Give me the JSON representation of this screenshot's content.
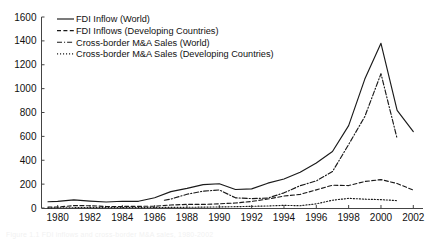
{
  "figure": {
    "caption": "Figure 1.1  FDI inflows and cross-border M&A sales, 1980-2002",
    "caption_visible": false
  },
  "chart_data": {
    "type": "line",
    "title": "",
    "xlabel": "",
    "ylabel": "",
    "xlim": [
      1979,
      2002.6
    ],
    "ylim": [
      0,
      1600
    ],
    "grid": false,
    "legend_position": "top-left-inside",
    "xticks": [
      1980,
      1982,
      1984,
      1986,
      1988,
      1990,
      1992,
      1994,
      1996,
      1998,
      2000,
      2002
    ],
    "xtick_labels": [
      "1980",
      "1982",
      "1984",
      "1986",
      "1988",
      "1990",
      "1992",
      "1994",
      "1996",
      "1998",
      "2000",
      "2002"
    ],
    "yticks": [
      0,
      200,
      400,
      600,
      800,
      1000,
      1200,
      1400,
      1600
    ],
    "ytick_labels": [
      "0",
      "200",
      "400",
      "600",
      "800",
      "1000",
      "1200",
      "1400",
      "1600"
    ],
    "series": [
      {
        "name": "FDI Inflow (World)",
        "style": "solid",
        "x": [
          1979.4,
          1980,
          1981,
          1982,
          1983,
          1984,
          1985,
          1986,
          1987,
          1988,
          1989,
          1990,
          1991,
          1992,
          1993,
          1994,
          1995,
          1996,
          1997,
          1998,
          1999,
          2000,
          2001,
          2002
        ],
        "values": [
          52,
          55,
          68,
          58,
          50,
          57,
          56,
          86,
          137,
          164,
          196,
          203,
          155,
          160,
          208,
          243,
          300,
          377,
          473,
          690,
          1080,
          1380,
          818,
          640
        ]
      },
      {
        "name": "FDI Inflows (Developing Countries)",
        "style": "dashed",
        "x": [
          1979.4,
          1980,
          1981,
          1982,
          1983,
          1984,
          1985,
          1986,
          1987,
          1988,
          1989,
          1990,
          1991,
          1992,
          1993,
          1994,
          1995,
          1996,
          1997,
          1998,
          1999,
          2000,
          2001,
          2002
        ],
        "values": [
          8,
          8,
          20,
          19,
          13,
          13,
          14,
          15,
          25,
          30,
          30,
          35,
          42,
          55,
          75,
          100,
          114,
          152,
          191,
          188,
          222,
          238,
          205,
          150
        ]
      },
      {
        "name": "Cross-border M&A Sales (World)",
        "style": "dashdot",
        "x": [
          1986.6,
          1987,
          1988,
          1989,
          1990,
          1991,
          1992,
          1993,
          1994,
          1995,
          1996,
          1997,
          1998,
          1999,
          2000,
          2001
        ],
        "values": [
          65,
          75,
          115,
          141,
          151,
          85,
          79,
          83,
          127,
          187,
          227,
          305,
          532,
          766,
          1125,
          580
        ]
      },
      {
        "name": "Cross-border M&A Sales (Developing Countries)",
        "style": "dotted",
        "x": [
          1979.4,
          1980,
          1982,
          1984,
          1986,
          1987,
          1988,
          1989,
          1990,
          1991,
          1992,
          1993,
          1994,
          1995,
          1996,
          1997,
          1998,
          1999,
          2000,
          2001
        ],
        "values": [
          1,
          2,
          3,
          3,
          4,
          5,
          6,
          7,
          9,
          11,
          14,
          17,
          22,
          19,
          35,
          65,
          81,
          74,
          70,
          62
        ]
      }
    ],
    "legend": [
      {
        "label": "FDI Inflow (World)",
        "style": "solid"
      },
      {
        "label": "FDI Inflows (Developing Countries)",
        "style": "dashed"
      },
      {
        "label": "Cross-border M&A Sales (World)",
        "style": "dashdot"
      },
      {
        "label": "Cross-border M&A Sales (Developing Countries)",
        "style": "dotted"
      }
    ]
  }
}
